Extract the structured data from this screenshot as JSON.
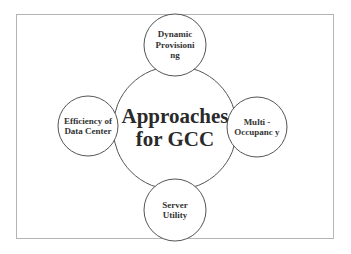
{
  "diagram": {
    "center": {
      "label": "Approaches for GCC"
    },
    "nodes": [
      {
        "id": "top",
        "label": "Dynamic Provisioni ng"
      },
      {
        "id": "right",
        "label": "Multi - Occupanc y"
      },
      {
        "id": "bottom",
        "label": "Server Utility"
      },
      {
        "id": "left",
        "label": "Efficiency of Data Center"
      }
    ]
  },
  "colors": {
    "stroke": "#555555",
    "frame": "#b4b4b4",
    "text": "#333333"
  }
}
